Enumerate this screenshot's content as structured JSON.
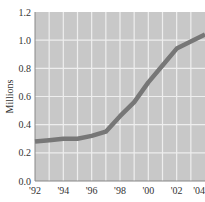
{
  "chart_data": {
    "type": "line",
    "title": "",
    "xlabel": "",
    "ylabel": "Millions",
    "x": [
      1992,
      1993,
      1994,
      1995,
      1996,
      1997,
      1998,
      1999,
      2000,
      2001,
      2002,
      2003,
      2004
    ],
    "x_tick_values": [
      1992,
      1994,
      1996,
      1998,
      2000,
      2002,
      2004
    ],
    "x_tick_labels": [
      "'92",
      "'94",
      "'96",
      "'98",
      "'00",
      "'02",
      "'04"
    ],
    "y_tick_values": [
      0.0,
      0.2,
      0.4,
      0.6,
      0.8,
      1.0,
      1.2
    ],
    "y_tick_labels": [
      "0.0",
      "0.2",
      "0.4",
      "0.6",
      "0.8",
      "1.0",
      "1.2"
    ],
    "xlim": [
      1992,
      2004
    ],
    "ylim": [
      0,
      1.2
    ],
    "grid": true,
    "legend": "none",
    "series": [
      {
        "name": "Millions",
        "values": [
          0.28,
          0.29,
          0.3,
          0.3,
          0.32,
          0.35,
          0.46,
          0.56,
          0.7,
          0.82,
          0.94,
          0.99,
          1.04
        ],
        "color": "#777777"
      }
    ],
    "colors": {
      "plot_background": "#c8c8c8",
      "gridline": "#eeeeee",
      "axis": "#888888"
    }
  }
}
